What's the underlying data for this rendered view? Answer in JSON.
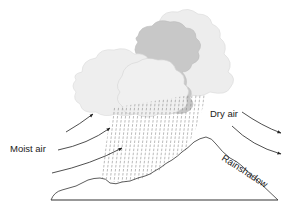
{
  "diagram": {
    "labels": {
      "moist_air": "Moist air",
      "dry_air": "Dry air",
      "rainshadow": "Rainshadow"
    },
    "colors": {
      "cloud_light": "#ebebeb",
      "cloud_mid": "#dcdcdc",
      "cloud_dark": "#c4c4c4",
      "outline": "#333333",
      "rain": "#888888",
      "background": "#ffffff"
    },
    "elements": [
      "clouds",
      "rain",
      "mountain",
      "moist-air-arrows",
      "dry-air-arrows",
      "ground-line"
    ]
  }
}
